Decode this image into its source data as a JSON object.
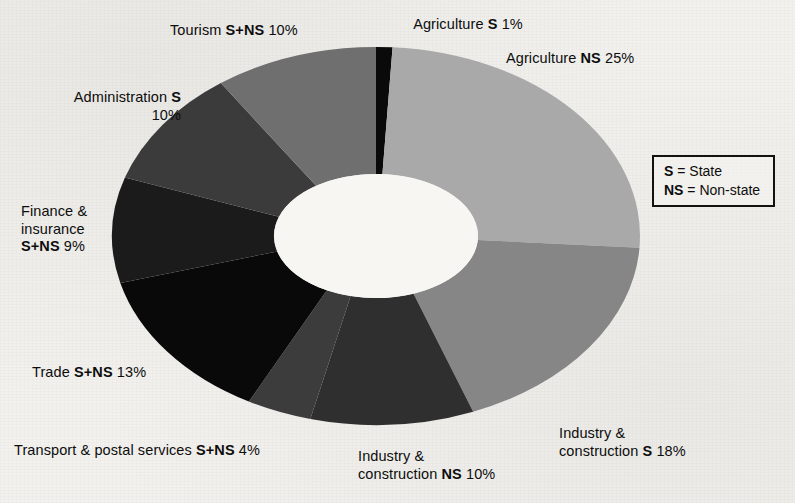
{
  "chart_data": {
    "type": "pie",
    "variant": "donut",
    "title": "",
    "subtitle": "",
    "xlabel": "",
    "ylabel": "",
    "units": "percent",
    "total": 100,
    "grid": false,
    "legend_position": "right",
    "start_angle_deg": 0,
    "direction": "clockwise",
    "categories": [
      "Agriculture S",
      "Agriculture NS",
      "Industry & construction S",
      "Industry & construction NS",
      "Transport & postal services S+NS",
      "Trade S+NS",
      "Finance & insurance S+NS",
      "Administration S",
      "Tourism S+NS"
    ],
    "values": [
      1,
      25,
      18,
      10,
      4,
      13,
      9,
      10,
      10
    ],
    "slices": [
      {
        "name": "Agriculture S",
        "sector": "Agriculture",
        "ownership": "S",
        "value": 1,
        "label": "Agriculture S 1%",
        "color": "#0a0a0a"
      },
      {
        "name": "Agriculture NS",
        "sector": "Agriculture",
        "ownership": "NS",
        "value": 25,
        "label": "Agriculture NS 25%",
        "color": "#a9a9a9"
      },
      {
        "name": "Industry & construction S",
        "sector": "Industry & construction",
        "ownership": "S",
        "value": 18,
        "label": "Industry & construction S 18%",
        "color": "#868686"
      },
      {
        "name": "Industry & construction NS",
        "sector": "Industry & construction",
        "ownership": "NS",
        "value": 10,
        "label": "Industry & construction NS 10%",
        "color": "#2f2f2f"
      },
      {
        "name": "Transport & postal services S+NS",
        "sector": "Transport & postal services",
        "ownership": "S+NS",
        "value": 4,
        "label": "Transport & postal services S+NS 4%",
        "color": "#3c3c3c"
      },
      {
        "name": "Trade S+NS",
        "sector": "Trade",
        "ownership": "S+NS",
        "value": 13,
        "label": "Trade S+NS 13%",
        "color": "#090909"
      },
      {
        "name": "Finance & insurance S+NS",
        "sector": "Finance & insurance",
        "ownership": "S+NS",
        "value": 9,
        "label": "Finance & insurance S+NS 9%",
        "color": "#1b1b1b"
      },
      {
        "name": "Administration S",
        "sector": "Administration",
        "ownership": "S",
        "value": 10,
        "label": "Administration S 10%",
        "color": "#3b3b3b"
      },
      {
        "name": "Tourism S+NS",
        "sector": "Tourism",
        "ownership": "S+NS",
        "value": 10,
        "label": "Tourism S+NS 10%",
        "color": "#6f6f6f"
      }
    ]
  },
  "labels": {
    "agriculture_s": {
      "text": "Agriculture ",
      "bold": "S",
      "tail": " 1%"
    },
    "agriculture_ns": {
      "text": "Agriculture ",
      "bold": "NS",
      "tail": " 25%"
    },
    "industry_s_l1": "Industry &",
    "industry_s_l2": {
      "text": "construction ",
      "bold": "S",
      "tail": " 18%"
    },
    "industry_ns_l1": "Industry &",
    "industry_ns_l2": {
      "text": "construction ",
      "bold": "NS",
      "tail": " 10%"
    },
    "transport": {
      "text": "Transport & postal services ",
      "bold": "S+NS",
      "tail": " 4%"
    },
    "trade": {
      "text": "Trade ",
      "bold": "S+NS",
      "tail": " 13%"
    },
    "finance_l1": "Finance &",
    "finance_l2": "insurance",
    "finance_l3": {
      "bold": "S+NS",
      "tail": " 9%"
    },
    "administration_l1": {
      "text": "Administration ",
      "bold": "S"
    },
    "administration_l2": "10%",
    "tourism": {
      "text": "Tourism ",
      "bold": "S+NS",
      "tail": " 10%"
    }
  },
  "legend": {
    "rows": [
      {
        "abbr": "S",
        "sep": " = ",
        "meaning": "State"
      },
      {
        "abbr": "NS",
        "sep": " = ",
        "meaning": "Non-state"
      }
    ]
  },
  "geometry": {
    "center_x": 376,
    "center_y": 236,
    "outer_rx": 264,
    "outer_ry": 189,
    "inner_rx": 102,
    "inner_ry": 62
  },
  "colors": {
    "background": "#f2f1ee",
    "ink": "#0d0d0d",
    "hole": "#f7f6f3"
  }
}
